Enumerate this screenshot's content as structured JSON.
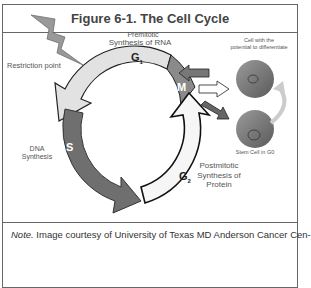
{
  "figure": {
    "title": "Figure 6-1. The Cell Cycle",
    "note_prefix": "Note.",
    "note_text": " Image courtesy of University of Texas MD Anderson Cancer Cen-"
  },
  "diagram": {
    "phases": [
      {
        "id": "G1",
        "label": "G",
        "sub": "1",
        "description_top": "Premitotic",
        "description": "Synthesis of RNA",
        "color": "#e2e2e2"
      },
      {
        "id": "S",
        "label": "S",
        "description": "DNA\nSynthesis",
        "color": "#6f6f6f"
      },
      {
        "id": "G2",
        "label": "G",
        "sub": "2",
        "description": "Postmitotic\nSynthesis of\nProtein",
        "color": "#f4f4f4"
      },
      {
        "id": "M",
        "label": "M",
        "color": "#888888"
      }
    ],
    "restriction_point": "Restriction point",
    "cell_differentiate": "Cell with the\npotential to differentiate",
    "stem_cell": "Stem Cell in G0"
  }
}
